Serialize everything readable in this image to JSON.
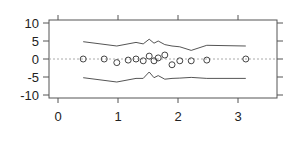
{
  "chart_data": {
    "type": "scatter",
    "title": "",
    "xlabel": "",
    "ylabel": "",
    "xlim": [
      -0.15,
      3.65
    ],
    "ylim": [
      -11,
      11
    ],
    "x_ticks": [
      0,
      1,
      2,
      3
    ],
    "x_tick_labels": [
      "0",
      "1",
      "2",
      "3"
    ],
    "y_ticks": [
      10,
      5,
      0,
      -5,
      -10
    ],
    "y_tick_labels": [
      "10",
      "5",
      "0",
      "-5",
      "-10"
    ],
    "grid": false,
    "reference_line": {
      "y": 0,
      "style": "dotted"
    },
    "points": {
      "x": [
        0.42,
        0.77,
        0.98,
        1.17,
        1.3,
        1.42,
        1.52,
        1.6,
        1.67,
        1.78,
        1.9,
        2.03,
        2.22,
        2.48,
        3.13
      ],
      "y": [
        0.0,
        0.0,
        -1.0,
        -0.3,
        0.0,
        -0.5,
        0.8,
        -0.5,
        0.3,
        1.1,
        -1.6,
        -0.5,
        -0.5,
        -0.3,
        0.0
      ]
    },
    "series": [
      {
        "name": "upper envelope",
        "x": [
          0.42,
          0.98,
          1.3,
          1.42,
          1.52,
          1.6,
          1.67,
          1.78,
          1.9,
          2.03,
          2.22,
          2.48,
          3.13
        ],
        "y": [
          4.8,
          3.6,
          4.6,
          4.2,
          5.5,
          4.4,
          5.0,
          4.0,
          3.6,
          3.4,
          2.4,
          3.8,
          3.6
        ]
      },
      {
        "name": "lower envelope",
        "x": [
          0.42,
          0.98,
          1.3,
          1.42,
          1.52,
          1.6,
          1.67,
          1.78,
          1.9,
          2.03,
          2.22,
          2.48,
          3.13
        ],
        "y": [
          -5.2,
          -6.4,
          -5.4,
          -5.4,
          -3.6,
          -5.2,
          -4.6,
          -5.6,
          -5.4,
          -5.3,
          -5.1,
          -5.4,
          -5.4
        ]
      }
    ]
  }
}
